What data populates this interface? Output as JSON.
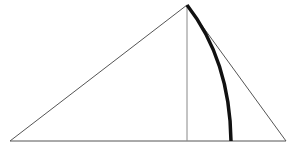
{
  "diagram": {
    "type": "geometric-construction",
    "colors": {
      "background": "#ffffff",
      "thin_line": "#555555",
      "altitude_line": "#888888",
      "arc": "#111111"
    },
    "points": {
      "apex": [
        187,
        5
      ],
      "base_left": [
        10,
        141
      ],
      "base_right": [
        286,
        141
      ],
      "altitude_foot": [
        187,
        141
      ],
      "arc_end": [
        231,
        141
      ]
    },
    "elements": [
      {
        "name": "triangle-side-left",
        "from": "apex",
        "to": "base_left"
      },
      {
        "name": "triangle-side-right",
        "from": "apex",
        "to": "base_right"
      },
      {
        "name": "triangle-base",
        "from": "base_left",
        "to": "base_right"
      },
      {
        "name": "altitude",
        "from": "apex",
        "to": "altitude_foot"
      },
      {
        "name": "arc",
        "from": "apex",
        "to": "arc_end",
        "style": "thick"
      }
    ]
  }
}
